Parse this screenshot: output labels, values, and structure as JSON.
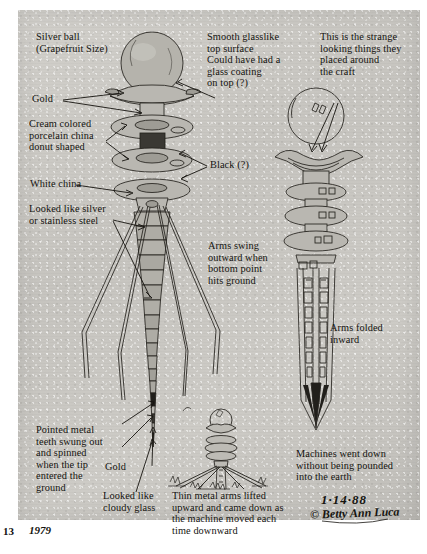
{
  "document": {
    "kind": "hand-annotated pencil sketch on aged paper",
    "page_number": "13",
    "year_note": "1979",
    "date_stamp": "1·14·88",
    "signature": "© Betty Ann Luca"
  },
  "annotations": {
    "silver_ball": "Silver ball\n(Grapefruit Size)",
    "gold_top": "Gold",
    "cream_china": "Cream colored\nporcelain china\ndonut shaped",
    "white_china": "White china",
    "silver_steel": "Looked like silver\nor stainless steel",
    "smooth_glass": "Smooth glasslike\ntop surface\nCould have had a\nglass coating\non top (?)",
    "black_q": "Black (?)",
    "strange_things": "This is the strange\nlooking things they\nplaced around\nthe craft",
    "arms_swing": "Arms swing\noutward when\nbottom point\nhits ground",
    "arms_folded": "Arms folded\ninward",
    "pointed_teeth": "Pointed metal\nteeth swung out\nand spinned\nwhen the tip\nentered the\nground",
    "gold_tip": "Gold",
    "cloudy_glass": "Looked like\ncloudy glass",
    "thin_arms": "Thin metal arms lifted\nupward and came down as\nthe machine moved each\ntime downward",
    "machines_down": "Machines went down\nwithout being pounded\ninto the earth"
  },
  "figures": {
    "main_probe": "large probe with silver ball, stacked china discs, segmented tapered shaft and four splayed legs",
    "folded_probe": "probe with arms folded inward, discs stacked, dark pointed tip",
    "small_probe": "small probe standing in ground with legs deployed"
  },
  "colors": {
    "paper": "#c9c7c2",
    "ink": "#15130f",
    "sphere": "#b5b3ac",
    "dark_band": "#211f1b"
  }
}
